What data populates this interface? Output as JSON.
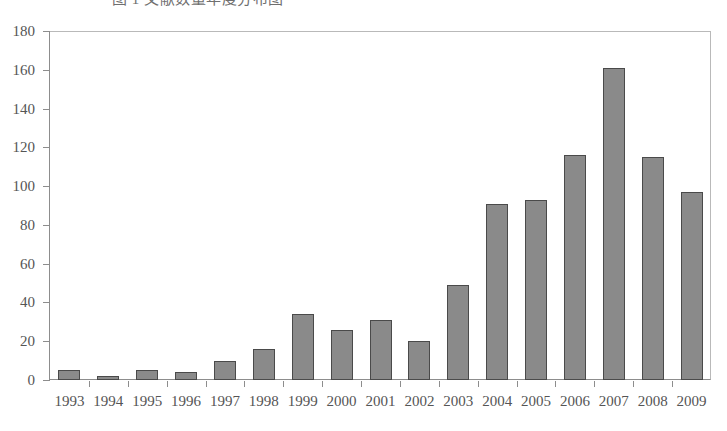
{
  "caption": {
    "text": "图 1  文献数量年度分布图"
  },
  "chart_data": {
    "type": "bar",
    "title": "",
    "xlabel": "",
    "ylabel": "",
    "ylim": [
      0,
      180
    ],
    "ytick_step": 20,
    "grid": false,
    "legend": "none",
    "bar_color": "#8a8a8a",
    "bar_border_color": "#4a4a4a",
    "axis_color": "#8d8d8d",
    "categories": [
      "1993",
      "1994",
      "1995",
      "1996",
      "1997",
      "1998",
      "1999",
      "2000",
      "2001",
      "2002",
      "2003",
      "2004",
      "2005",
      "2006",
      "2007",
      "2008",
      "2009"
    ],
    "values": [
      5,
      2,
      5,
      4,
      10,
      16,
      34,
      26,
      31,
      20,
      49,
      91,
      93,
      116,
      161,
      115,
      97
    ],
    "ytick_labels": [
      "0",
      "20",
      "40",
      "60",
      "80",
      "100",
      "120",
      "140",
      "160",
      "180"
    ],
    "ytick_values": [
      0,
      20,
      40,
      60,
      80,
      100,
      120,
      140,
      160,
      180
    ]
  }
}
